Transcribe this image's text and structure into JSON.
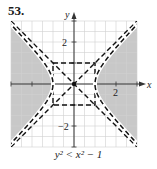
{
  "problem_number": "53.",
  "caption": "y² < x² − 1",
  "chart_data": {
    "type": "area",
    "title": "",
    "inequality": "y^2 < x^2 - 1",
    "xlabel": "x",
    "ylabel": "y",
    "xlim": [
      -3,
      3
    ],
    "ylim": [
      -3,
      3
    ],
    "grid": true,
    "grid_step": 0.5,
    "x_tick_labels": [
      {
        "value": 2,
        "label": "2"
      }
    ],
    "y_tick_labels": [
      {
        "value": 2,
        "label": "2"
      },
      {
        "value": -2,
        "label": "−2"
      }
    ],
    "boundary": {
      "equation": "x^2 - y^2 = 1",
      "style": "dashed",
      "vertices": [
        [
          -1,
          0
        ],
        [
          1,
          0
        ]
      ]
    },
    "asymptotes": [
      {
        "equation": "y = x",
        "style": "dashed"
      },
      {
        "equation": "y = -x",
        "style": "dashed"
      }
    ],
    "fundamental_rectangle": {
      "x": [
        -1,
        1
      ],
      "y": [
        -1,
        1
      ],
      "style": "dashed"
    },
    "shaded_region": "|x| > sqrt(y^2 + 1)",
    "shade_color": "#c8c8c8",
    "grid_color": "#d0d0d0",
    "axis_color": "#333333"
  }
}
